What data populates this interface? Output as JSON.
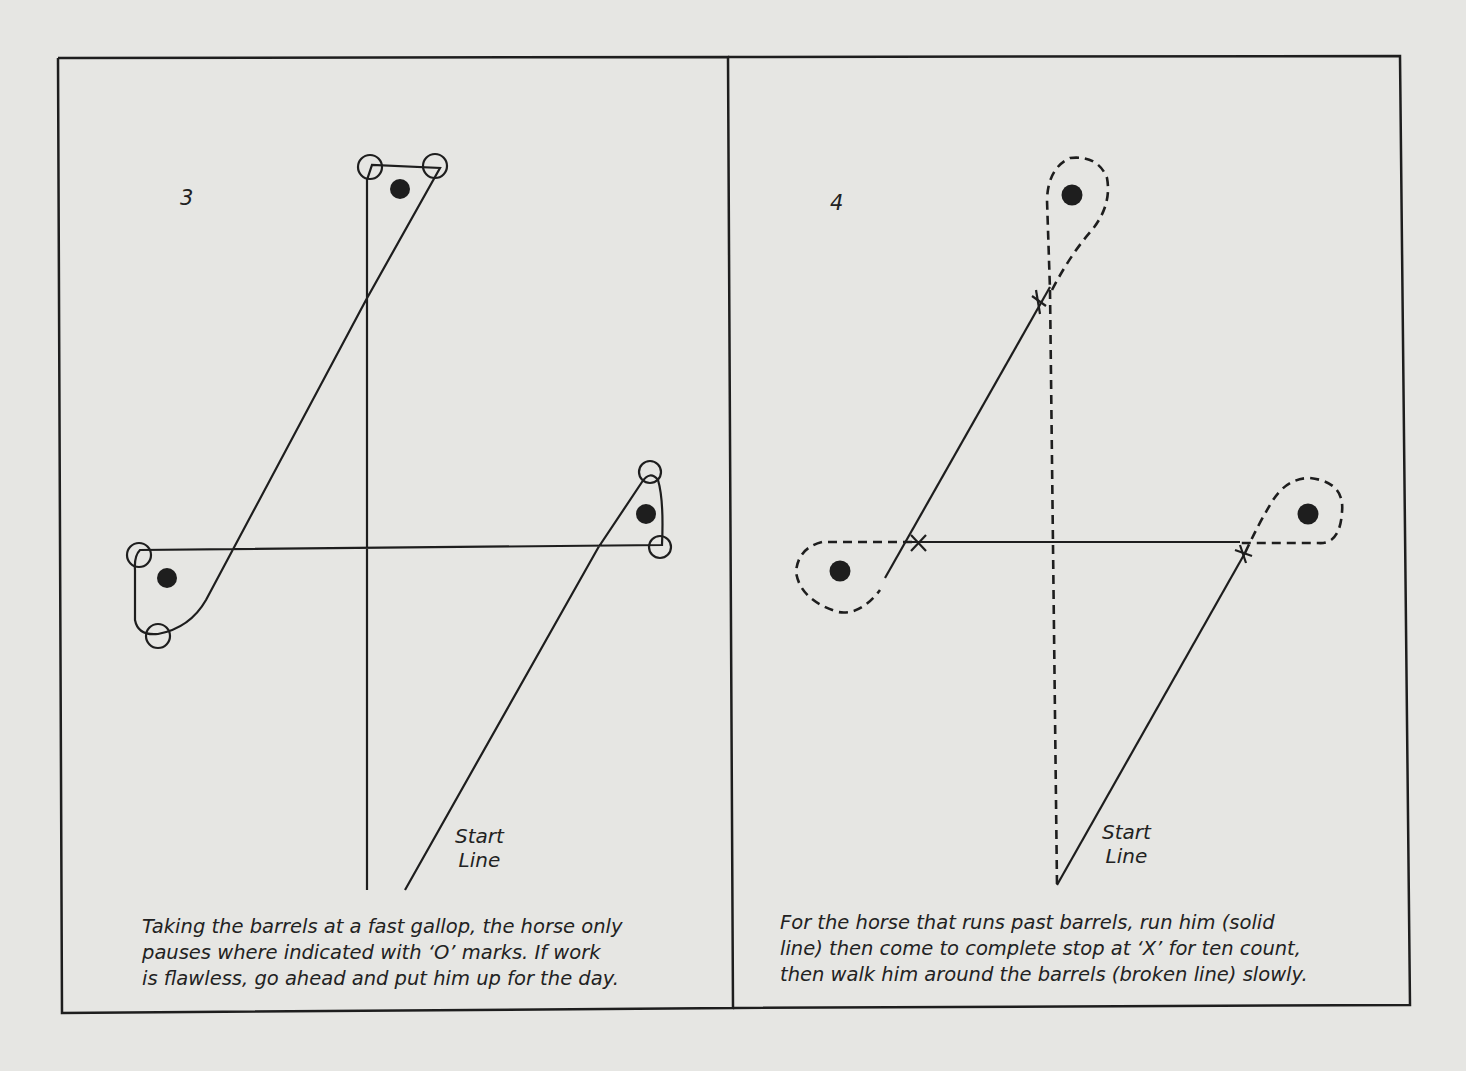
{
  "figure": {
    "colors": {
      "paper": "#e6e6e3",
      "ink": "#1e1e1e"
    },
    "panels": [
      {
        "number": "3",
        "start_label": [
          "Start",
          "Line"
        ],
        "caption": [
          "Taking the barrels at a fast gallop, the horse only",
          "pauses where indicated with ‘O’ marks. If work",
          "is flawless, go ahead and put him up for the day."
        ],
        "path_style": "solid",
        "pause_mark": "O",
        "pause_mark_count": 6,
        "barrels": [
          "left",
          "right",
          "top"
        ]
      },
      {
        "number": "4",
        "start_label": [
          "Start",
          "Line"
        ],
        "caption": [
          "For the horse that runs past barrels, run him (solid",
          "line) then come to complete stop at ‘X’ for ten count,",
          "then walk him around the barrels (broken line) slowly."
        ],
        "path_style": "solid run + broken walk",
        "stop_mark": "X",
        "stop_mark_count": 3,
        "barrels": [
          "left",
          "right",
          "top"
        ]
      }
    ]
  }
}
